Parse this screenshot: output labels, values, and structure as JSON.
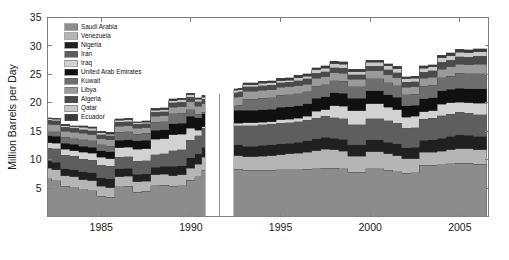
{
  "chart_data": {
    "type": "area",
    "stacked": true,
    "title": "",
    "xlabel": "",
    "ylabel": "Million Barrels per Day",
    "xlim": [
      1982.0,
      2006.6
    ],
    "ylim": [
      0,
      35
    ],
    "xticks": [
      1985,
      1990,
      1995,
      2000,
      2005
    ],
    "xtick_labels": [
      "1985",
      "1990",
      "1995",
      "2000",
      "2005"
    ],
    "yticks": [
      5,
      10,
      15,
      20,
      25,
      30,
      35
    ],
    "ytick_labels": [
      "5",
      "10",
      "15",
      "20",
      "25",
      "30",
      "35"
    ],
    "grid": false,
    "legend_position": "upper-left-inside",
    "x": [
      1982.0,
      1982.5,
      1983.0,
      1983.5,
      1984.0,
      1984.5,
      1985.0,
      1985.5,
      1986.0,
      1986.5,
      1987.0,
      1987.5,
      1988.0,
      1988.5,
      1989.0,
      1989.5,
      1990.0,
      1990.4,
      1990.8,
      1991.2,
      1991.6,
      1992.0,
      1992.4,
      1992.8,
      1993.0,
      1993.5,
      1994.0,
      1994.5,
      1995.0,
      1995.5,
      1996.0,
      1996.5,
      1997.0,
      1997.5,
      1998.0,
      1998.5,
      1999.0,
      1999.5,
      2000.0,
      2000.5,
      2001.0,
      2001.5,
      2002.0,
      2002.5,
      2003.0,
      2003.5,
      2004.0,
      2004.5,
      2005.0,
      2005.5,
      2006.0,
      2006.5
    ],
    "gaps": [
      [
        1990.45,
        1990.75
      ],
      [
        1991.1,
        1991.35
      ],
      [
        1991.75,
        1992.05
      ]
    ],
    "series": [
      {
        "name": "Saudi Arabia",
        "color": "#8c8c8c",
        "values": [
          6.6,
          6.3,
          5.3,
          5.1,
          4.7,
          4.5,
          3.6,
          3.4,
          5.2,
          5.3,
          4.3,
          4.4,
          5.4,
          5.5,
          5.3,
          5.4,
          6.4,
          7.0,
          8.1,
          8.3,
          8.3,
          8.3,
          8.3,
          8.3,
          8.1,
          8.1,
          8.1,
          8.1,
          8.2,
          8.2,
          8.2,
          8.3,
          8.4,
          8.5,
          8.5,
          8.4,
          7.8,
          7.8,
          8.4,
          8.4,
          8.1,
          7.9,
          7.6,
          7.7,
          9.0,
          9.0,
          9.1,
          9.3,
          9.4,
          9.4,
          9.2,
          9.2
        ]
      },
      {
        "name": "Venezuela",
        "color": "#b5b5b5",
        "values": [
          1.9,
          1.9,
          1.9,
          1.9,
          1.8,
          1.8,
          1.7,
          1.7,
          1.8,
          1.8,
          1.8,
          1.8,
          1.9,
          1.9,
          1.9,
          1.9,
          2.1,
          2.2,
          2.3,
          2.4,
          2.4,
          2.4,
          2.4,
          2.4,
          2.4,
          2.4,
          2.5,
          2.6,
          2.7,
          2.8,
          2.9,
          3.0,
          3.2,
          3.3,
          3.2,
          3.1,
          2.8,
          2.8,
          3.0,
          3.0,
          2.9,
          2.8,
          2.6,
          2.5,
          2.3,
          2.3,
          2.4,
          2.4,
          2.5,
          2.5,
          2.5,
          2.5
        ]
      },
      {
        "name": "Nigeria",
        "color": "#202020",
        "values": [
          1.3,
          1.3,
          1.2,
          1.2,
          1.4,
          1.4,
          1.5,
          1.5,
          1.4,
          1.4,
          1.3,
          1.3,
          1.4,
          1.4,
          1.6,
          1.6,
          1.8,
          1.8,
          1.8,
          1.8,
          1.8,
          1.8,
          1.9,
          1.9,
          1.9,
          1.9,
          1.9,
          1.9,
          1.9,
          1.9,
          2.0,
          2.0,
          2.1,
          2.1,
          2.1,
          2.1,
          2.0,
          2.0,
          2.1,
          2.1,
          2.1,
          2.1,
          1.9,
          2.0,
          2.1,
          2.2,
          2.3,
          2.4,
          2.5,
          2.4,
          2.4,
          2.4
        ]
      },
      {
        "name": "Iran",
        "color": "#5e5e5e",
        "values": [
          2.2,
          2.4,
          2.4,
          2.4,
          2.2,
          2.2,
          2.2,
          2.2,
          2.0,
          2.0,
          2.3,
          2.3,
          2.2,
          2.2,
          2.8,
          2.8,
          3.1,
          3.2,
          3.3,
          3.3,
          3.3,
          3.4,
          3.4,
          3.4,
          3.6,
          3.6,
          3.6,
          3.6,
          3.6,
          3.6,
          3.6,
          3.6,
          3.6,
          3.7,
          3.6,
          3.6,
          3.5,
          3.5,
          3.7,
          3.7,
          3.7,
          3.6,
          3.4,
          3.4,
          3.7,
          3.8,
          3.9,
          3.9,
          3.9,
          3.9,
          3.8,
          3.8
        ]
      },
      {
        "name": "Iraq",
        "color": "#d2d2d2",
        "values": [
          1.0,
          1.0,
          1.0,
          1.0,
          1.2,
          1.2,
          1.4,
          1.4,
          1.7,
          1.7,
          2.1,
          2.1,
          2.7,
          2.7,
          2.8,
          2.8,
          2.1,
          1.0,
          0.3,
          0.3,
          0.3,
          0.4,
          0.4,
          0.4,
          0.5,
          0.5,
          0.5,
          0.5,
          0.6,
          0.6,
          0.6,
          0.7,
          1.2,
          1.2,
          2.1,
          2.2,
          2.5,
          2.5,
          2.6,
          2.6,
          2.4,
          2.4,
          2.0,
          2.0,
          1.3,
          1.3,
          2.0,
          2.0,
          1.8,
          1.8,
          2.0,
          2.0
        ]
      },
      {
        "name": "United Arab Emirates",
        "color": "#101010",
        "values": [
          1.2,
          1.2,
          1.1,
          1.1,
          1.1,
          1.1,
          1.2,
          1.2,
          1.3,
          1.3,
          1.5,
          1.5,
          1.6,
          1.6,
          1.9,
          1.9,
          2.1,
          2.2,
          2.3,
          2.3,
          2.3,
          2.3,
          2.3,
          2.3,
          2.2,
          2.2,
          2.2,
          2.2,
          2.2,
          2.2,
          2.2,
          2.2,
          2.3,
          2.3,
          2.3,
          2.3,
          2.2,
          2.2,
          2.3,
          2.3,
          2.2,
          2.2,
          2.0,
          2.0,
          2.3,
          2.3,
          2.4,
          2.4,
          2.5,
          2.5,
          2.6,
          2.6
        ]
      },
      {
        "name": "Kuwait",
        "color": "#6e6e6e",
        "values": [
          0.8,
          0.8,
          1.0,
          1.0,
          1.1,
          1.1,
          1.0,
          1.0,
          1.4,
          1.4,
          1.2,
          1.2,
          1.4,
          1.4,
          1.8,
          1.8,
          1.2,
          0.6,
          0.2,
          0.2,
          0.2,
          0.6,
          0.8,
          0.9,
          1.9,
          1.9,
          2.0,
          2.0,
          2.1,
          2.1,
          2.1,
          2.1,
          2.1,
          2.1,
          2.1,
          2.1,
          2.0,
          2.0,
          2.1,
          2.1,
          2.1,
          2.0,
          1.9,
          1.9,
          2.2,
          2.2,
          2.3,
          2.3,
          2.6,
          2.6,
          2.6,
          2.6
        ]
      },
      {
        "name": "Libya",
        "color": "#9a9a9a",
        "values": [
          1.2,
          1.2,
          1.1,
          1.1,
          1.1,
          1.1,
          1.1,
          1.1,
          1.1,
          1.1,
          1.0,
          1.0,
          1.0,
          1.0,
          1.1,
          1.1,
          1.4,
          1.4,
          1.5,
          1.5,
          1.5,
          1.5,
          1.5,
          1.5,
          1.4,
          1.4,
          1.4,
          1.4,
          1.4,
          1.4,
          1.4,
          1.4,
          1.4,
          1.4,
          1.4,
          1.4,
          1.3,
          1.3,
          1.4,
          1.4,
          1.4,
          1.4,
          1.3,
          1.3,
          1.4,
          1.4,
          1.5,
          1.6,
          1.6,
          1.6,
          1.7,
          1.7
        ]
      },
      {
        "name": "Algeria",
        "color": "#4a4a4a",
        "values": [
          0.7,
          0.7,
          0.7,
          0.7,
          0.7,
          0.7,
          0.7,
          0.7,
          0.7,
          0.7,
          0.7,
          0.7,
          0.7,
          0.7,
          0.8,
          0.8,
          0.8,
          0.8,
          0.8,
          0.8,
          0.8,
          0.8,
          0.8,
          0.8,
          0.8,
          0.8,
          0.8,
          0.8,
          0.8,
          0.8,
          0.9,
          0.9,
          0.9,
          0.9,
          0.9,
          0.9,
          0.8,
          0.8,
          0.8,
          0.8,
          0.9,
          0.9,
          0.9,
          0.9,
          1.1,
          1.1,
          1.2,
          1.2,
          1.3,
          1.3,
          1.4,
          1.4
        ]
      },
      {
        "name": "Qatar",
        "color": "#c8c8c8",
        "values": [
          0.3,
          0.3,
          0.3,
          0.3,
          0.4,
          0.4,
          0.3,
          0.3,
          0.3,
          0.3,
          0.3,
          0.3,
          0.4,
          0.4,
          0.4,
          0.4,
          0.4,
          0.4,
          0.4,
          0.4,
          0.4,
          0.4,
          0.4,
          0.4,
          0.4,
          0.4,
          0.4,
          0.4,
          0.4,
          0.4,
          0.5,
          0.5,
          0.6,
          0.6,
          0.7,
          0.7,
          0.6,
          0.6,
          0.7,
          0.7,
          0.7,
          0.7,
          0.6,
          0.6,
          0.7,
          0.7,
          0.8,
          0.8,
          0.8,
          0.8,
          0.8,
          0.8
        ]
      },
      {
        "name": "Ecuador",
        "color": "#3a3a3a",
        "values": [
          0.2,
          0.2,
          0.2,
          0.2,
          0.3,
          0.3,
          0.3,
          0.3,
          0.3,
          0.3,
          0.2,
          0.2,
          0.3,
          0.3,
          0.3,
          0.3,
          0.3,
          0.3,
          0.3,
          0.3,
          0.3,
          0.3,
          0.3,
          0.3,
          0.3,
          0.3,
          0.4,
          0.4,
          0.4,
          0.4,
          0.4,
          0.4,
          0.4,
          0.4,
          0.4,
          0.4,
          0.4,
          0.4,
          0.4,
          0.4,
          0.4,
          0.4,
          0.4,
          0.4,
          0.4,
          0.4,
          0.5,
          0.5,
          0.5,
          0.5,
          0.5,
          0.5
        ]
      }
    ]
  },
  "legend": {
    "items": [
      {
        "label": "Saudi Arabia"
      },
      {
        "label": "Venezuela"
      },
      {
        "label": "Nigeria"
      },
      {
        "label": "Iran"
      },
      {
        "label": "Iraq"
      },
      {
        "label": "United Arab Emirates"
      },
      {
        "label": "Kuwait"
      },
      {
        "label": "Libya"
      },
      {
        "label": "Algeria"
      },
      {
        "label": "Qatar"
      },
      {
        "label": "Ecuador"
      }
    ]
  },
  "style": {
    "axis_color": "#808080",
    "text_color": "#1a1a1a",
    "background": "#ffffff",
    "band_edge_color": "#555555"
  }
}
